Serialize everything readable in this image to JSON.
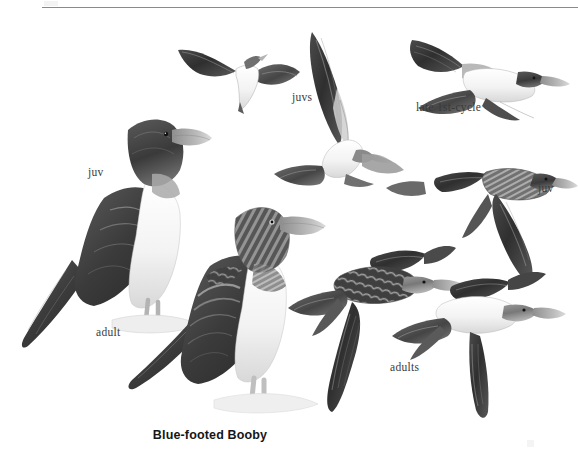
{
  "page": {
    "species_name": "Blue-footed Booby",
    "background_color": "#ffffff",
    "ink_color": "#3a3a3a",
    "rule_color": "#8a8a8a"
  },
  "labels": {
    "juv_left": "juv",
    "juvs": "juvs",
    "late_first_cycle": "late 1st-cycle",
    "juv_right": "juv",
    "adult": "adult",
    "adults": "adults"
  },
  "figures": [
    {
      "id": "flying-juv-distant",
      "label": "juvs",
      "plumage": "juvenile",
      "pose": "flying-overhead-distant",
      "x": 175,
      "y": 30
    },
    {
      "id": "flying-juv-banking",
      "label": "juvs",
      "plumage": "juvenile",
      "pose": "flying-banking-underside",
      "x": 300,
      "y": 30
    },
    {
      "id": "flying-late-1st-cycle",
      "label": "late 1st-cycle",
      "plumage": "late 1st-cycle",
      "pose": "flying-underside",
      "x": 405,
      "y": 30
    },
    {
      "id": "standing-juv",
      "label": "juv",
      "plumage": "juvenile",
      "pose": "standing-perched",
      "x": 40,
      "y": 100
    },
    {
      "id": "flying-juv-upperside",
      "label": "juv",
      "plumage": "juvenile",
      "pose": "flying-upperside",
      "x": 430,
      "y": 155
    },
    {
      "id": "standing-adult",
      "label": "adult",
      "plumage": "adult",
      "pose": "standing-perched",
      "x": 160,
      "y": 195
    },
    {
      "id": "flying-adult-upperside",
      "label": "adults",
      "plumage": "adult",
      "pose": "flying-upperside",
      "x": 295,
      "y": 245
    },
    {
      "id": "flying-adult-underside",
      "label": "adults",
      "plumage": "adult",
      "pose": "flying-underside",
      "x": 440,
      "y": 265
    }
  ]
}
